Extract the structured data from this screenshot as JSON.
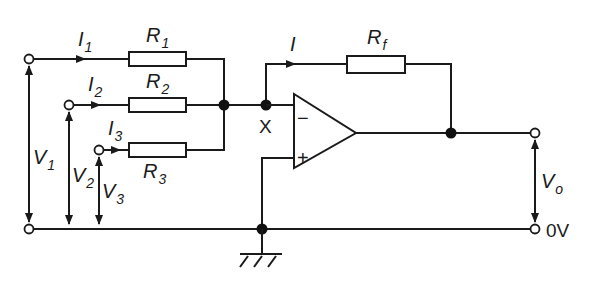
{
  "diagram": {
    "type": "summing-amplifier-circuit",
    "inputs": [
      {
        "voltage_label": "V",
        "voltage_sub": "1",
        "current_label": "I",
        "current_sub": "1",
        "resistor_label": "R",
        "resistor_sub": "1"
      },
      {
        "voltage_label": "V",
        "voltage_sub": "2",
        "current_label": "I",
        "current_sub": "2",
        "resistor_label": "R",
        "resistor_sub": "2"
      },
      {
        "voltage_label": "V",
        "voltage_sub": "3",
        "current_label": "I",
        "current_sub": "3",
        "resistor_label": "R",
        "resistor_sub": "3"
      }
    ],
    "feedback": {
      "current_label": "I",
      "resistor_label": "R",
      "resistor_sub": "f"
    },
    "node_label": "X",
    "opamp": {
      "inverting_sign": "−",
      "noninverting_sign": "+"
    },
    "output": {
      "voltage_label": "V",
      "voltage_sub": "o",
      "ground_label": "0V"
    },
    "colors": {
      "line": "#1a1a1a",
      "background": "#ffffff"
    }
  }
}
